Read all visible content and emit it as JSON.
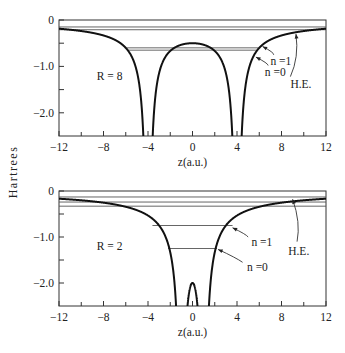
{
  "figure": {
    "shared_ylabel": "Hartrees"
  },
  "chart_data": [
    {
      "type": "line",
      "title": "",
      "panel_label": "R = 8",
      "xlabel": "z(a.u.)",
      "ylabel": "Hartrees",
      "xlim": [
        -12,
        12
      ],
      "ylim": [
        -2.5,
        0
      ],
      "x_ticks": [
        -12,
        -8,
        -4,
        0,
        4,
        8,
        12
      ],
      "x_tick_labels": [
        "−12",
        "−8",
        "−4",
        "0",
        "4",
        "8",
        "12"
      ],
      "x_minor_ticks": [
        -10,
        -6,
        -2,
        2,
        6,
        10
      ],
      "y_ticks": [
        0,
        -1.0,
        -2.0
      ],
      "y_tick_labels": [
        "0",
        "−1.0",
        "−2.0"
      ],
      "y_minor_ticks": [
        -0.5,
        -1.5
      ],
      "grid": false,
      "potential": {
        "name": "two-center potential",
        "formula": "V(z) = -1/|z - R/2| - 1/|z + R/2|",
        "R": 8
      },
      "levels": [
        {
          "name": "level-a",
          "y": -0.15,
          "x": [
            -12,
            12
          ]
        },
        {
          "name": "level-b",
          "y": -0.21,
          "x": [
            -12,
            12
          ]
        },
        {
          "name": "n=1",
          "y": -0.6,
          "x": [
            -6.1,
            6.1
          ]
        },
        {
          "name": "n=0",
          "y": -0.65,
          "x": [
            -5.8,
            5.8
          ]
        }
      ],
      "annotations": [
        {
          "text": "n =1",
          "x": 7.0,
          "y": -0.88
        },
        {
          "text": "n =0",
          "x": 6.5,
          "y": -1.12
        },
        {
          "text": "H.E.",
          "x": 8.8,
          "y": -1.38
        }
      ],
      "arrows": [
        {
          "from": [
            7.3,
            -0.75
          ],
          "to": [
            6.3,
            -0.57
          ]
        },
        {
          "from": [
            6.8,
            -0.98
          ],
          "to": [
            5.7,
            -0.8
          ]
        },
        {
          "from": [
            8.8,
            -1.22
          ],
          "to": [
            9.3,
            -0.3
          ]
        }
      ]
    },
    {
      "type": "line",
      "title": "",
      "panel_label": "R = 2",
      "xlabel": "z(a.u.)",
      "ylabel": "Hartrees",
      "xlim": [
        -12,
        12
      ],
      "ylim": [
        -2.5,
        0
      ],
      "x_ticks": [
        -12,
        -8,
        -4,
        0,
        4,
        8,
        12
      ],
      "x_tick_labels": [
        "−12",
        "−8",
        "−4",
        "0",
        "4",
        "8",
        "12"
      ],
      "x_minor_ticks": [
        -10,
        -6,
        -2,
        2,
        6,
        10
      ],
      "y_ticks": [
        0,
        -1.0,
        -2.0
      ],
      "y_tick_labels": [
        "0",
        "−1.0",
        "−2.0"
      ],
      "y_minor_ticks": [
        -0.5,
        -1.5
      ],
      "grid": false,
      "potential": {
        "name": "two-center potential",
        "formula": "V(z) = -1/|z - R/2| - 1/|z + R/2|",
        "R": 2
      },
      "levels": [
        {
          "name": "level-a",
          "y": -0.13,
          "x": [
            -12,
            12
          ]
        },
        {
          "name": "level-b",
          "y": -0.24,
          "x": [
            -12,
            12
          ]
        },
        {
          "name": "level-c",
          "y": -0.33,
          "x": [
            -12,
            12
          ]
        },
        {
          "name": "n=1",
          "y": -0.75,
          "x": [
            -3.6,
            3.6
          ]
        },
        {
          "name": "n=0",
          "y": -1.25,
          "x": [
            -2.2,
            2.2
          ]
        }
      ],
      "annotations": [
        {
          "text": "n =1",
          "x": 5.3,
          "y": -1.1
        },
        {
          "text": "n =0",
          "x": 4.9,
          "y": -1.65
        },
        {
          "text": "H.E.",
          "x": 8.6,
          "y": -1.3
        }
      ],
      "arrows": [
        {
          "from": [
            5.0,
            -1.0
          ],
          "to": [
            3.6,
            -0.8
          ]
        },
        {
          "from": [
            4.5,
            -1.55
          ],
          "to": [
            2.3,
            -1.27
          ]
        },
        {
          "from": [
            9.4,
            -1.1
          ],
          "to": [
            9.0,
            -0.18
          ]
        }
      ]
    }
  ]
}
